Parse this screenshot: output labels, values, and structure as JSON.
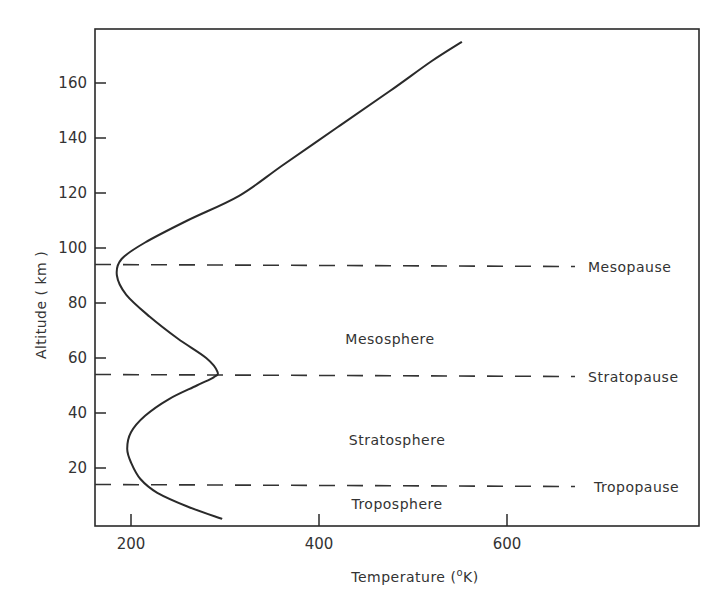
{
  "chart_data": {
    "type": "line",
    "title": "",
    "xlabel": "Temperature (°K)",
    "ylabel": "Altitude ( km )",
    "xlim": [
      160,
      780
    ],
    "ylim": [
      0,
      177
    ],
    "x_ticks": [
      200,
      400,
      600
    ],
    "y_ticks": [
      20,
      40,
      60,
      80,
      100,
      120,
      140,
      160
    ],
    "grid": false,
    "series": [
      {
        "name": "Temperature profile",
        "points": [
          {
            "temperature": 297,
            "altitude": 1.5
          },
          {
            "temperature": 260,
            "altitude": 6
          },
          {
            "temperature": 228,
            "altitude": 11
          },
          {
            "temperature": 210,
            "altitude": 16
          },
          {
            "temperature": 200,
            "altitude": 22
          },
          {
            "temperature": 196,
            "altitude": 27
          },
          {
            "temperature": 200,
            "altitude": 33
          },
          {
            "temperature": 215,
            "altitude": 39
          },
          {
            "temperature": 240,
            "altitude": 45
          },
          {
            "temperature": 270,
            "altitude": 50
          },
          {
            "temperature": 288,
            "altitude": 53
          },
          {
            "temperature": 292,
            "altitude": 55
          },
          {
            "temperature": 280,
            "altitude": 60
          },
          {
            "temperature": 250,
            "altitude": 67
          },
          {
            "temperature": 220,
            "altitude": 75
          },
          {
            "temperature": 195,
            "altitude": 83
          },
          {
            "temperature": 185,
            "altitude": 90
          },
          {
            "temperature": 190,
            "altitude": 96
          },
          {
            "temperature": 215,
            "altitude": 102
          },
          {
            "temperature": 260,
            "altitude": 110
          },
          {
            "temperature": 315,
            "altitude": 119
          },
          {
            "temperature": 361,
            "altitude": 130
          },
          {
            "temperature": 420,
            "altitude": 144
          },
          {
            "temperature": 475,
            "altitude": 157
          },
          {
            "temperature": 520,
            "altitude": 168
          },
          {
            "temperature": 552,
            "altitude": 175
          }
        ]
      }
    ],
    "boundaries": [
      {
        "name": "Mesopause",
        "altitude": 94
      },
      {
        "name": "Stratopause",
        "altitude": 54
      },
      {
        "name": "Tropopause",
        "altitude": 14
      }
    ],
    "regions": [
      {
        "name": "Mesosphere",
        "altitude": 67
      },
      {
        "name": "Stratosphere",
        "altitude": 30
      },
      {
        "name": "Troposphere",
        "altitude": 7
      }
    ],
    "annotations": [
      "Mesopause",
      "Stratopause",
      "Tropopause",
      "Mesosphere",
      "Stratosphere",
      "Troposphere"
    ]
  },
  "labels": {
    "xlabel": "Temperature (",
    "xlabel_unit_sup": "o",
    "xlabel_unit": "K)",
    "ylabel": "Altitude ( km )"
  }
}
